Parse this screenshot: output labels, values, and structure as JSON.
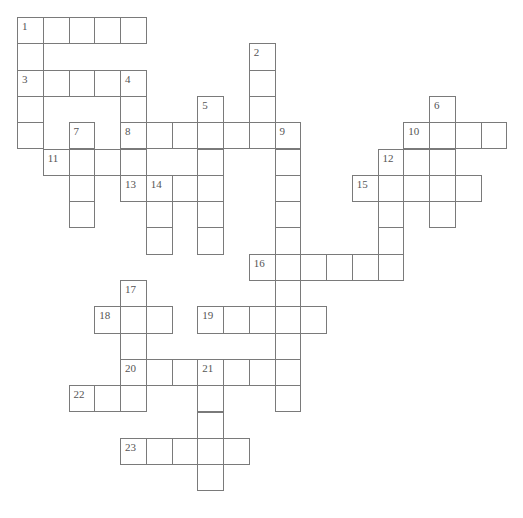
{
  "puzzle": {
    "cell_width": 25.75,
    "cell_height": 26.3,
    "origin_x": 17,
    "origin_y": 17,
    "cells": [
      {
        "c": 0,
        "r": 0,
        "n": "1"
      },
      {
        "c": 1,
        "r": 0
      },
      {
        "c": 2,
        "r": 0
      },
      {
        "c": 3,
        "r": 0
      },
      {
        "c": 4,
        "r": 0
      },
      {
        "c": 0,
        "r": 1
      },
      {
        "c": 9,
        "r": 1,
        "n": "2"
      },
      {
        "c": 0,
        "r": 2,
        "n": "3"
      },
      {
        "c": 1,
        "r": 2
      },
      {
        "c": 2,
        "r": 2
      },
      {
        "c": 3,
        "r": 2
      },
      {
        "c": 4,
        "r": 2,
        "n": "4"
      },
      {
        "c": 9,
        "r": 2
      },
      {
        "c": 0,
        "r": 3
      },
      {
        "c": 4,
        "r": 3
      },
      {
        "c": 7,
        "r": 3,
        "n": "5"
      },
      {
        "c": 9,
        "r": 3
      },
      {
        "c": 16,
        "r": 3,
        "n": "6"
      },
      {
        "c": 0,
        "r": 4
      },
      {
        "c": 2,
        "r": 4,
        "n": "7"
      },
      {
        "c": 4,
        "r": 4,
        "n": "8"
      },
      {
        "c": 5,
        "r": 4
      },
      {
        "c": 6,
        "r": 4
      },
      {
        "c": 7,
        "r": 4
      },
      {
        "c": 8,
        "r": 4
      },
      {
        "c": 9,
        "r": 4
      },
      {
        "c": 10,
        "r": 4,
        "n": "9"
      },
      {
        "c": 15,
        "r": 4,
        "n": "10"
      },
      {
        "c": 16,
        "r": 4
      },
      {
        "c": 17,
        "r": 4
      },
      {
        "c": 18,
        "r": 4
      },
      {
        "c": 1,
        "r": 5,
        "n": "11"
      },
      {
        "c": 2,
        "r": 5
      },
      {
        "c": 3,
        "r": 5
      },
      {
        "c": 4,
        "r": 5
      },
      {
        "c": 7,
        "r": 5
      },
      {
        "c": 10,
        "r": 5
      },
      {
        "c": 14,
        "r": 5,
        "n": "12"
      },
      {
        "c": 15,
        "r": 5
      },
      {
        "c": 16,
        "r": 5
      },
      {
        "c": 2,
        "r": 6
      },
      {
        "c": 4,
        "r": 6,
        "n": "13"
      },
      {
        "c": 5,
        "r": 6,
        "n": "14"
      },
      {
        "c": 6,
        "r": 6
      },
      {
        "c": 7,
        "r": 6
      },
      {
        "c": 10,
        "r": 6
      },
      {
        "c": 13,
        "r": 6,
        "n": "15"
      },
      {
        "c": 14,
        "r": 6
      },
      {
        "c": 15,
        "r": 6
      },
      {
        "c": 16,
        "r": 6
      },
      {
        "c": 17,
        "r": 6
      },
      {
        "c": 2,
        "r": 7
      },
      {
        "c": 5,
        "r": 7
      },
      {
        "c": 7,
        "r": 7
      },
      {
        "c": 10,
        "r": 7
      },
      {
        "c": 14,
        "r": 7
      },
      {
        "c": 16,
        "r": 7
      },
      {
        "c": 5,
        "r": 8
      },
      {
        "c": 7,
        "r": 8
      },
      {
        "c": 10,
        "r": 8
      },
      {
        "c": 14,
        "r": 8
      },
      {
        "c": 9,
        "r": 9,
        "n": "16"
      },
      {
        "c": 10,
        "r": 9
      },
      {
        "c": 11,
        "r": 9
      },
      {
        "c": 12,
        "r": 9
      },
      {
        "c": 13,
        "r": 9
      },
      {
        "c": 14,
        "r": 9
      },
      {
        "c": 4,
        "r": 10,
        "n": "17"
      },
      {
        "c": 10,
        "r": 10
      },
      {
        "c": 3,
        "r": 11,
        "n": "18"
      },
      {
        "c": 4,
        "r": 11
      },
      {
        "c": 5,
        "r": 11
      },
      {
        "c": 7,
        "r": 11,
        "n": "19"
      },
      {
        "c": 8,
        "r": 11
      },
      {
        "c": 9,
        "r": 11
      },
      {
        "c": 10,
        "r": 11
      },
      {
        "c": 11,
        "r": 11
      },
      {
        "c": 4,
        "r": 12
      },
      {
        "c": 10,
        "r": 12
      },
      {
        "c": 4,
        "r": 13,
        "n": "20"
      },
      {
        "c": 5,
        "r": 13
      },
      {
        "c": 6,
        "r": 13
      },
      {
        "c": 7,
        "r": 13,
        "n": "21"
      },
      {
        "c": 8,
        "r": 13
      },
      {
        "c": 9,
        "r": 13
      },
      {
        "c": 10,
        "r": 13
      },
      {
        "c": 2,
        "r": 14,
        "n": "22"
      },
      {
        "c": 3,
        "r": 14
      },
      {
        "c": 4,
        "r": 14
      },
      {
        "c": 7,
        "r": 14
      },
      {
        "c": 10,
        "r": 14
      },
      {
        "c": 7,
        "r": 15
      },
      {
        "c": 4,
        "r": 16,
        "n": "23"
      },
      {
        "c": 5,
        "r": 16
      },
      {
        "c": 6,
        "r": 16
      },
      {
        "c": 7,
        "r": 16
      },
      {
        "c": 8,
        "r": 16
      },
      {
        "c": 7,
        "r": 17
      }
    ]
  },
  "colors": {
    "border": "#7a7a7a",
    "number": "#555555",
    "background": "#ffffff"
  }
}
